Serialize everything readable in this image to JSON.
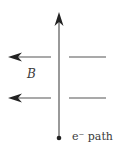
{
  "diagram": {
    "field_label": "B",
    "path_label": "e⁻ path",
    "colors": {
      "line": "#555555",
      "arrowhead": "#222222",
      "text": "#3a3a3a",
      "background": "#ffffff"
    },
    "elements": {
      "electron_path": {
        "direction": "up",
        "x": 59,
        "y_start": 138,
        "y_end": 13
      },
      "field_lines": [
        {
          "direction": "left",
          "y": 57,
          "left_segment": [
            9,
            51
          ],
          "right_segment": [
            69,
            106
          ]
        },
        {
          "direction": "left",
          "y": 98,
          "left_segment": [
            9,
            51
          ],
          "right_segment": [
            69,
            106
          ]
        }
      ]
    }
  }
}
